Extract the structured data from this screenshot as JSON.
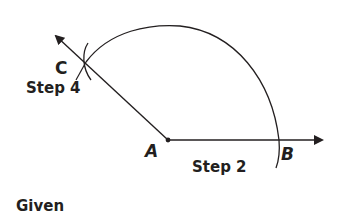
{
  "diagram": {
    "colors": {
      "stroke": "#231f20",
      "background": "#ffffff"
    },
    "points": {
      "A": {
        "label": "A"
      },
      "B": {
        "label": "B"
      },
      "C": {
        "label": "C"
      }
    },
    "steps": {
      "step2": "Step 2",
      "step4": "Step 4"
    },
    "caption": "Given"
  }
}
